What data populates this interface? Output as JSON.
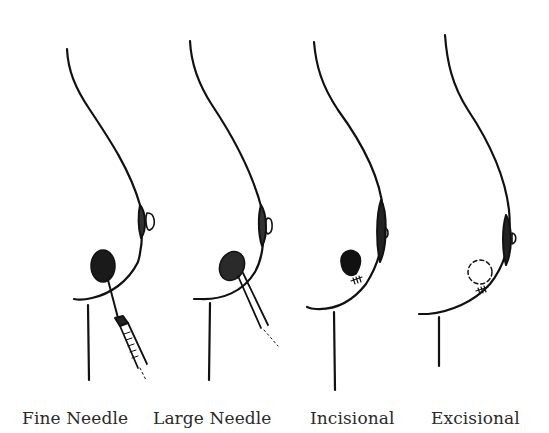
{
  "diagram": {
    "type": "medical-illustration",
    "panels": [
      {
        "label": "Fine Needle",
        "x": 22,
        "instrument": "syringe-with-fine-needle"
      },
      {
        "label": "Large Needle",
        "x": 153,
        "instrument": "core-needle"
      },
      {
        "label": "Incisional",
        "x": 310,
        "instrument": "partial-lesion-with-sutures"
      },
      {
        "label": "Excisional",
        "x": 431,
        "instrument": "removed-lesion-outline-with-sutures"
      }
    ],
    "colors": {
      "ink": "#111111",
      "background": "#ffffff",
      "label": "#2a2a2a"
    }
  }
}
